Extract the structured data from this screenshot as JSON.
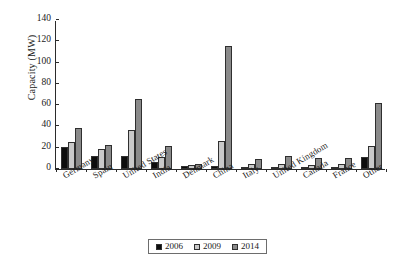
{
  "chart_data": {
    "type": "bar",
    "title": "",
    "xlabel": "",
    "ylabel": "Capacity (MW)",
    "ylim": [
      0,
      140
    ],
    "yticks": [
      0,
      20,
      40,
      60,
      80,
      100,
      120,
      140
    ],
    "grid": false,
    "legend_position": "bottom",
    "categories": [
      "Germany",
      "Spain",
      "United States",
      "India",
      "Denmark",
      "China",
      "Italy",
      "United Kingdom",
      "Canada",
      "France",
      "Other"
    ],
    "series": [
      {
        "name": "2006",
        "color": "#0d0d0d",
        "values": [
          21,
          12,
          12,
          7,
          3,
          3,
          2,
          2,
          2,
          2,
          11
        ]
      },
      {
        "name": "2009",
        "color": "#c9c9c9",
        "values": [
          25,
          19,
          37,
          11,
          4,
          26,
          5,
          5,
          4,
          5,
          22
        ]
      },
      {
        "name": "2014",
        "color": "#8a8a8a",
        "values": [
          39,
          23,
          66,
          22,
          5,
          116,
          9,
          12,
          10,
          10,
          62
        ]
      }
    ]
  },
  "axis": {
    "y_title": "Capacity (MW)"
  },
  "legend": {
    "entries": [
      {
        "label": "2006",
        "color": "#0d0d0d"
      },
      {
        "label": "2009",
        "color": "#c9c9c9"
      },
      {
        "label": "2014",
        "color": "#8a8a8a"
      }
    ]
  }
}
